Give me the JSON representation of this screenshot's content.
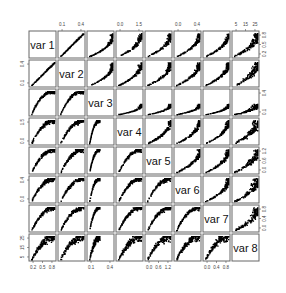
{
  "chart_data": {
    "type": "scatter-matrix",
    "title": "",
    "variables": [
      "var 1",
      "var 2",
      "var 3",
      "var 4",
      "var 5",
      "var 6",
      "var 7",
      "var 8"
    ],
    "diagonal_labels": [
      "var 1",
      "var 2",
      "var 3",
      "var 4",
      "var 5",
      "var 6",
      "var 7",
      "var 8"
    ],
    "axis_ticks": {
      "var 1": {
        "side": "bottom/left",
        "labels": [
          "0.2",
          "0.5",
          "0.8"
        ],
        "range": [
          0.1,
          0.9
        ]
      },
      "var 2": {
        "side": "top/right",
        "labels": [
          "0.1",
          "0.4"
        ],
        "range": [
          0.0,
          0.6
        ]
      },
      "var 3": {
        "side": "bottom/left",
        "labels": [
          "0.1",
          "0.4"
        ],
        "range": [
          0.0,
          0.5
        ]
      },
      "var 4": {
        "side": "top/right",
        "labels": [
          "0.0",
          "1.5"
        ],
        "range": [
          0.0,
          2.0
        ]
      },
      "var 5": {
        "side": "bottom/left",
        "labels": [
          "0.0",
          "0.6",
          "1.2"
        ],
        "range": [
          0.0,
          1.4
        ]
      },
      "var 6": {
        "side": "top/right",
        "labels": [
          "0.0",
          "0.4"
        ],
        "range": [
          0.0,
          0.6
        ]
      },
      "var 7": {
        "side": "bottom/left",
        "labels": [
          "0.0",
          "0.4",
          "0.8"
        ],
        "range": [
          0.0,
          0.9
        ]
      },
      "var 8": {
        "side": "top/right",
        "labels": [
          "5",
          "15",
          "25"
        ],
        "range": [
          0,
          28
        ]
      }
    },
    "top_axis_labels": [
      {
        "column": 2,
        "labels": [
          "0.1",
          "0.4"
        ]
      },
      {
        "column": 4,
        "labels": [
          "0.0",
          "1.5"
        ]
      },
      {
        "column": 6,
        "labels": [
          "0.0",
          "0.4"
        ]
      },
      {
        "column": 8,
        "labels": [
          "5",
          "15",
          "25"
        ]
      }
    ],
    "bottom_axis_labels": [
      {
        "column": 1,
        "labels": [
          "0.2",
          "0.5",
          "0.8"
        ]
      },
      {
        "column": 3,
        "labels": [
          "0.1",
          "0.4"
        ]
      },
      {
        "column": 5,
        "labels": [
          "0.0",
          "0.6",
          "1.2"
        ]
      },
      {
        "column": 7,
        "labels": [
          "0.0",
          "0.4",
          "0.8"
        ]
      }
    ],
    "left_axis_labels": [
      {
        "row": 2,
        "labels": [
          "0.1",
          "0.4"
        ]
      },
      {
        "row": 4,
        "labels": [
          "0.0",
          "1.5"
        ]
      },
      {
        "row": 6,
        "labels": [
          "0.0",
          "0.4"
        ]
      },
      {
        "row": 8,
        "labels": [
          "5",
          "15",
          "25"
        ]
      }
    ],
    "right_axis_labels": [
      {
        "row": 1,
        "labels": [
          "0.2",
          "0.5",
          "0.8"
        ]
      },
      {
        "row": 3,
        "labels": [
          "0.1",
          "0.4"
        ]
      },
      {
        "row": 5,
        "labels": [
          "0.0",
          "0.6",
          "1.2"
        ]
      },
      {
        "row": 7,
        "labels": [
          "0.0",
          "0.4",
          "0.8"
        ]
      }
    ],
    "relationships": "All variable pairs show strong positive association; var1-var2 near linear, others concave/saturating with fan-shaped spread, var8 panels show wide heteroscedastic clouds",
    "point_color": "#000000",
    "grid": false,
    "legend": null
  },
  "layout": {
    "n": 8,
    "origin_x": 29,
    "origin_y": 31,
    "panel_size": 27,
    "gap": 2
  }
}
